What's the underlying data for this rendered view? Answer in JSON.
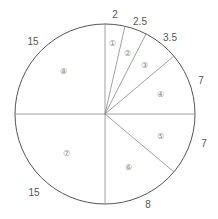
{
  "diagram": {
    "type": "pie-division",
    "center": [
      105,
      114
    ],
    "radius": 90,
    "segments": [
      {
        "id": "1",
        "marker": "①",
        "value": "2"
      },
      {
        "id": "2",
        "marker": "②",
        "value": "2.5"
      },
      {
        "id": "3",
        "marker": "③",
        "value": "3.5"
      },
      {
        "id": "4",
        "marker": "④",
        "value": "7"
      },
      {
        "id": "5",
        "marker": "⑤",
        "value": "7"
      },
      {
        "id": "6",
        "marker": "⑥",
        "value": "8"
      },
      {
        "id": "7",
        "marker": "⑦",
        "value": "15"
      },
      {
        "id": "8",
        "marker": "⑧",
        "value": "15"
      }
    ]
  }
}
